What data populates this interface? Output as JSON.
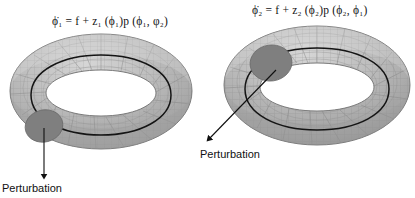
{
  "figure": {
    "title_present": false,
    "background_color": "#ffffff",
    "width": 415,
    "height": 198
  },
  "palette": {
    "torus_fill": "#b9b9b9",
    "torus_mesh_line": "#8d8d8d",
    "torus_outline": "#6f6f6f",
    "torus_highlight": "#d2d2d2",
    "torus_shadow": "#9a9a9a",
    "perturbation_blob": "#7f7f7f",
    "perturbation_blob_edge": "#6a6a6a",
    "core_curve": "#141414",
    "arrow_color": "#101010",
    "text_color": "#111111"
  },
  "panels": [
    {
      "id": "left",
      "equation": {
        "lhs": "ϕ̇₁",
        "full": "ϕ̇₁ = f + z₁ (ϕ₁)p (ϕ₁, φ₂)",
        "parts": {
          "lhs_symbol": "ϕ",
          "lhs_accent": "dot",
          "lhs_subscript": "1",
          "equals": "=",
          "term_f": "f",
          "plus": "+",
          "coupling_symbol": "z",
          "coupling_subscript": "1",
          "coupling_arg": "(ϕ₁)",
          "phase_symbol": "p",
          "phase_args": "(ϕ₁, φ₂)"
        }
      },
      "annotation": {
        "label": "Perturbation",
        "arrow_direction": "down"
      }
    },
    {
      "id": "right",
      "equation": {
        "lhs": "ϕ̇₂",
        "full": "ϕ̇₂ = f + z₂ (ϕ₂)p (ϕ₂, ϕ₁)",
        "parts": {
          "lhs_symbol": "ϕ",
          "lhs_accent": "dot",
          "lhs_subscript": "2",
          "equals": "=",
          "term_f": "f",
          "plus": "+",
          "coupling_symbol": "z",
          "coupling_subscript": "2",
          "coupling_arg": "(ϕ₂)",
          "phase_symbol": "p",
          "phase_args": "(ϕ₂, ϕ₁)"
        }
      },
      "annotation": {
        "label": "Perturbation",
        "arrow_direction": "down-left"
      }
    }
  ],
  "diagram": {
    "object_type": "torus",
    "count": 2,
    "features": [
      "wireframe-mesh-surface",
      "dark-core-phase-circle",
      "shaded-perturbation-patch"
    ]
  }
}
